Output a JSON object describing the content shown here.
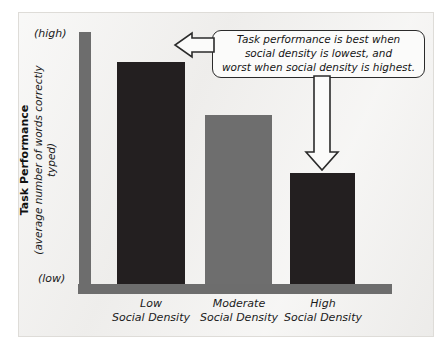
{
  "figure": {
    "background_color": "#f1f0ee",
    "frame_color": "#dedcd8"
  },
  "axis": {
    "vertical_color": "#6d6d6d",
    "horizontal_color": "#6d6d6d",
    "high_label": "(high)",
    "low_label": "(low)",
    "y_title_main": "Task Performance",
    "y_title_sub": "(average number of words correctly typed)"
  },
  "callout": {
    "text": "Task performance is best when\nsocial density is lowest, and\nworst when social density is highest.",
    "border_color": "#2b2b2b",
    "fill_color": "#fbfbfa",
    "arrow_left_target": "low-social-density-bar",
    "arrow_down_target": "high-social-density-bar"
  },
  "chart_data": {
    "type": "bar",
    "title": "",
    "xlabel": "",
    "ylabel": "Task Performance (average number of words correctly typed)",
    "categories": [
      "Low\nSocial Density",
      "Moderate\nSocial Density",
      "High\nSocial Density"
    ],
    "category_lines": [
      [
        "Low",
        "Social Density"
      ],
      [
        "Moderate",
        "Social Density"
      ],
      [
        "High",
        "Social Density"
      ]
    ],
    "values": [
      88,
      67,
      44
    ],
    "ylim": [
      0,
      100
    ],
    "ytick_labels": [
      "(low)",
      "(high)"
    ],
    "grid": false,
    "legend": "none",
    "bar_colors": [
      "#231f20",
      "#6e6e6e",
      "#231f20"
    ],
    "annotations": [
      "Task performance is best when social density is lowest, and worst when social density is highest."
    ]
  }
}
